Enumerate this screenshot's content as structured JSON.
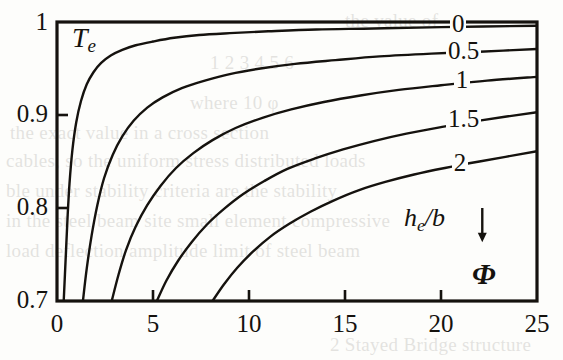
{
  "figure": {
    "kind": "line-chart",
    "y_axis_symbol": "T",
    "y_axis_subscript": "e",
    "x_axis_symbol": "Φ",
    "family_label_symbol": "h",
    "family_label_subscript": "e",
    "family_label_tail": "/b",
    "family_arrow": "↓",
    "ink_color": "#15120e",
    "paper_color": "#fdfdfb"
  },
  "background_text": {
    "lines": [
      "the value of",
      "1 2 3 4 5 6",
      "where   10  φ",
      "the exact value in a cross section",
      "cables, so the uniform stress distributed loads",
      "ble under stability criteria are the stability",
      "in the steel beam site small element compressive",
      "load deflection amplitude limit of steel beam",
      "2 Stayed Bridge structure"
    ]
  },
  "chart_data": {
    "type": "line",
    "title": "",
    "xlabel": "Φ",
    "ylabel": "Te",
    "xlim": [
      0,
      25
    ],
    "ylim": [
      0.7,
      1.0
    ],
    "xticks": [
      0,
      5,
      10,
      15,
      20,
      25
    ],
    "xtick_labels": [
      "0",
      "5",
      "10",
      "15",
      "20",
      "25"
    ],
    "yticks": [
      0.7,
      0.8,
      0.9,
      1.0
    ],
    "ytick_labels": [
      "0.7",
      "0.8",
      "0.9",
      "1"
    ],
    "grid": false,
    "legend_position": "inline-right",
    "legend_title": "he/b",
    "annotations": [
      {
        "text": "he/b",
        "x": 19.2,
        "y": 0.778
      },
      {
        "text": "↓",
        "x": 22.2,
        "y": 0.778
      },
      {
        "text": "Φ",
        "x": 23.5,
        "y": 0.733
      }
    ],
    "series": [
      {
        "name": "0",
        "label": "0",
        "label_x": 21.4,
        "label_y": 0.9925,
        "points": [
          [
            0.35,
            0.7
          ],
          [
            0.45,
            0.745
          ],
          [
            0.55,
            0.79
          ],
          [
            0.65,
            0.826
          ],
          [
            0.8,
            0.862
          ],
          [
            1.0,
            0.892
          ],
          [
            1.25,
            0.915
          ],
          [
            1.55,
            0.933
          ],
          [
            1.9,
            0.946
          ],
          [
            2.3,
            0.956
          ],
          [
            2.8,
            0.964
          ],
          [
            3.4,
            0.97
          ],
          [
            4.1,
            0.975
          ],
          [
            5.0,
            0.979
          ],
          [
            6.1,
            0.983
          ],
          [
            7.4,
            0.986
          ],
          [
            9.0,
            0.988
          ],
          [
            11.0,
            0.99
          ],
          [
            13.5,
            0.992
          ],
          [
            16.5,
            0.993
          ],
          [
            20.0,
            0.9945
          ],
          [
            25.0,
            0.996
          ]
        ]
      },
      {
        "name": "0.5",
        "label": "0.5",
        "label_x": 21.2,
        "label_y": 0.9635,
        "points": [
          [
            1.35,
            0.7
          ],
          [
            1.55,
            0.735
          ],
          [
            1.8,
            0.77
          ],
          [
            2.1,
            0.803
          ],
          [
            2.45,
            0.832
          ],
          [
            2.9,
            0.857
          ],
          [
            3.4,
            0.877
          ],
          [
            4.0,
            0.894
          ],
          [
            4.7,
            0.908
          ],
          [
            5.5,
            0.919
          ],
          [
            6.5,
            0.929
          ],
          [
            7.7,
            0.937
          ],
          [
            9.0,
            0.944
          ],
          [
            10.6,
            0.95
          ],
          [
            12.4,
            0.955
          ],
          [
            14.5,
            0.959
          ],
          [
            16.8,
            0.963
          ],
          [
            19.5,
            0.966
          ],
          [
            22.0,
            0.968
          ],
          [
            25.0,
            0.971
          ]
        ]
      },
      {
        "name": "1",
        "label": "1",
        "label_x": 21.6,
        "label_y": 0.9325,
        "points": [
          [
            2.85,
            0.7
          ],
          [
            3.2,
            0.728
          ],
          [
            3.6,
            0.755
          ],
          [
            4.1,
            0.78
          ],
          [
            4.7,
            0.803
          ],
          [
            5.4,
            0.824
          ],
          [
            6.2,
            0.843
          ],
          [
            7.1,
            0.859
          ],
          [
            8.1,
            0.873
          ],
          [
            9.3,
            0.886
          ],
          [
            10.7,
            0.897
          ],
          [
            12.2,
            0.906
          ],
          [
            13.9,
            0.914
          ],
          [
            15.8,
            0.921
          ],
          [
            17.8,
            0.927
          ],
          [
            20.0,
            0.932
          ],
          [
            22.4,
            0.937
          ],
          [
            25.0,
            0.941
          ]
        ]
      },
      {
        "name": "1.5",
        "label": "1.5",
        "label_x": 21.2,
        "label_y": 0.8905,
        "points": [
          [
            5.2,
            0.7
          ],
          [
            5.7,
            0.722
          ],
          [
            6.3,
            0.743
          ],
          [
            7.0,
            0.763
          ],
          [
            7.8,
            0.782
          ],
          [
            8.7,
            0.799
          ],
          [
            9.7,
            0.815
          ],
          [
            10.8,
            0.829
          ],
          [
            12.0,
            0.842
          ],
          [
            13.4,
            0.853
          ],
          [
            14.9,
            0.863
          ],
          [
            16.5,
            0.872
          ],
          [
            18.2,
            0.88
          ],
          [
            20.0,
            0.887
          ],
          [
            22.0,
            0.894
          ],
          [
            25.0,
            0.903
          ]
        ]
      },
      {
        "name": "2",
        "label": "2",
        "label_x": 21.5,
        "label_y": 0.8425,
        "points": [
          [
            8.1,
            0.7
          ],
          [
            8.7,
            0.718
          ],
          [
            9.4,
            0.736
          ],
          [
            10.2,
            0.753
          ],
          [
            11.1,
            0.769
          ],
          [
            12.1,
            0.783
          ],
          [
            13.2,
            0.796
          ],
          [
            14.4,
            0.808
          ],
          [
            15.7,
            0.819
          ],
          [
            17.1,
            0.828
          ],
          [
            18.6,
            0.836
          ],
          [
            20.2,
            0.843
          ],
          [
            22.0,
            0.85
          ],
          [
            25.0,
            0.861
          ]
        ]
      }
    ]
  }
}
